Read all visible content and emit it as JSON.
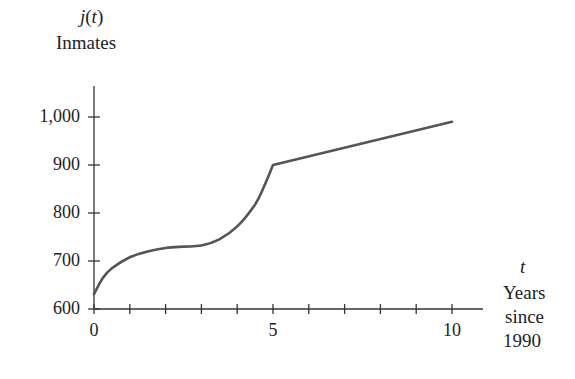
{
  "chart_data": {
    "type": "line",
    "title": "",
    "ylabel_func": "j(t)",
    "ylabel": "Inmates",
    "xlabel_var": "t",
    "xlabel": [
      "Years",
      "since",
      "1990"
    ],
    "xlim": [
      0,
      10.8
    ],
    "ylim": [
      600,
      1060
    ],
    "x_ticks": [
      0,
      1,
      2,
      3,
      4,
      5,
      6,
      7,
      8,
      9,
      10
    ],
    "x_tick_labels": [
      {
        "value": 0,
        "label": "0"
      },
      {
        "value": 5,
        "label": "5"
      },
      {
        "value": 10,
        "label": "10"
      }
    ],
    "y_ticks": [
      600,
      700,
      800,
      900,
      1000
    ],
    "y_tick_labels": [
      "600",
      "700",
      "800",
      "900",
      "1,000"
    ],
    "grid": false,
    "legend": null,
    "series": [
      {
        "name": "j(t)",
        "color": "#555555",
        "x": [
          0,
          0.25,
          0.5,
          1,
          1.5,
          2,
          2.5,
          3,
          3.5,
          4,
          4.5,
          4.75,
          5,
          10
        ],
        "values": [
          631,
          665,
          685,
          708,
          720,
          727,
          730,
          732,
          745,
          772,
          818,
          855,
          900,
          990
        ]
      }
    ]
  }
}
